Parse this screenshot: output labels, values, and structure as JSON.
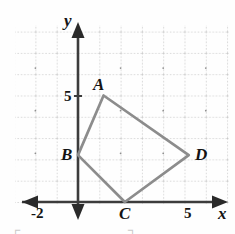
{
  "chart_data": {
    "type": "scatter",
    "title": "",
    "xlabel": "x",
    "ylabel": "y",
    "grid": true,
    "grid_step": 1,
    "xlim": [
      -2.9,
      7.3
    ],
    "ylim": [
      -1.5,
      8.5
    ],
    "x_ticks": [
      {
        "value": -2,
        "label": "-2"
      },
      {
        "value": 5,
        "label": "5"
      }
    ],
    "y_ticks": [
      {
        "value": 5,
        "label": "5"
      }
    ],
    "annotations": [
      {
        "label": "A",
        "x": 1.2,
        "y": 5.0
      },
      {
        "label": "B",
        "x": 0.0,
        "y": 2.2
      },
      {
        "label": "C",
        "x": 2.2,
        "y": 0.0
      },
      {
        "label": "D",
        "x": 5.2,
        "y": 2.2
      }
    ],
    "series": [
      {
        "name": "quadrilateral-ABCD",
        "type": "polygon",
        "closed": true,
        "color": "#8c8c8c",
        "points": [
          {
            "label": "A",
            "x": 1.2,
            "y": 5.0
          },
          {
            "label": "B",
            "x": 0.0,
            "y": 2.2
          },
          {
            "label": "C",
            "x": 2.2,
            "y": 0.0
          },
          {
            "label": "D",
            "x": 5.2,
            "y": 2.2
          }
        ]
      }
    ],
    "axis_color": "#3c3c3c",
    "grid_color": "#b8b8b8"
  },
  "labels": {
    "vertex_a": "A",
    "vertex_b": "B",
    "vertex_c": "C",
    "vertex_d": "D",
    "y_axis_name": "y",
    "x_axis_name": "x",
    "y_tick_5": "5",
    "x_tick_5": "5",
    "x_tick_neg2": "-2"
  },
  "artifacts": {
    "bracket_left": "┌",
    "bracket_right": "┐"
  }
}
